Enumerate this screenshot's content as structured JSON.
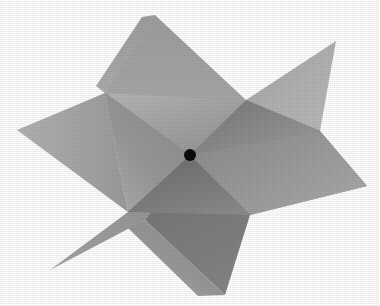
{
  "figure": {
    "background_color": "#ffffff",
    "canvas": {
      "width": 380,
      "height": 306
    },
    "center_point": {
      "label": "origin-dot",
      "x": 190,
      "y": 155,
      "radius": 6,
      "color": "#0b0b0b"
    },
    "palette": {
      "lightest": "#b4b4b4",
      "light": "#a6a6a6",
      "mid_light": "#9a9a9a",
      "mid": "#8e8e8e",
      "mid_dark": "#828282",
      "dark": "#747474",
      "darkest": "#686868",
      "seam": "#8a8a8a",
      "outline": "none"
    },
    "planes": [
      {
        "name": "plane-a-upper-left",
        "description": "Plane sweeping from upper area down to the lower left, lightest tone",
        "fill": "#a9a9a9",
        "points": "155,15 246,100 190,155 105,93"
      },
      {
        "name": "plane-a-lower-left-wing",
        "description": "Left wing of plane A ending in the far left tip",
        "fill": "#9e9e9e",
        "points": "105,93 190,155 128,212 17,130"
      },
      {
        "name": "plane-b-top-right",
        "description": "Upper right quadrant of plane B, mid tone",
        "fill": "#8d8d8d",
        "points": "246,100 336,41 320,131 190,155"
      },
      {
        "name": "plane-b-right-wing",
        "description": "Right wing of plane B extending to the right tip",
        "fill": "#959595",
        "points": "320,131 367,186 250,215 190,155"
      },
      {
        "name": "plane-c-lower",
        "description": "Lower plane panel with darker shading",
        "fill": "#7c7c7c",
        "points": "190,155 250,215 225,295 145,220"
      },
      {
        "name": "plane-c-lower-left",
        "description": "Lower left panel of plane C reaching the bottom left tip",
        "fill": "#8a8a8a",
        "points": "128,212 190,155 145,220 50,270"
      }
    ],
    "silhouette_tips": [
      {
        "name": "tip-top",
        "x": 155,
        "y": 15
      },
      {
        "name": "tip-upper-right",
        "x": 336,
        "y": 41
      },
      {
        "name": "tip-right",
        "x": 367,
        "y": 186
      },
      {
        "name": "tip-bottom",
        "x": 225,
        "y": 295
      },
      {
        "name": "tip-lower-left",
        "x": 50,
        "y": 270
      },
      {
        "name": "tip-left",
        "x": 17,
        "y": 130
      }
    ]
  }
}
